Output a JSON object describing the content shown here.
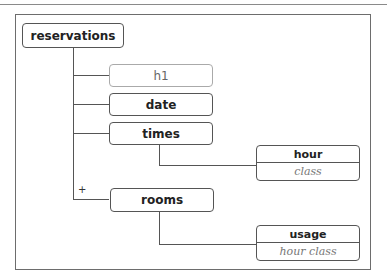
{
  "diagram": {
    "root": {
      "label": "reservations"
    },
    "children": [
      {
        "label": "h1",
        "style": "light"
      },
      {
        "label": "date"
      },
      {
        "label": "times"
      },
      {
        "label": "rooms",
        "marker": "+"
      }
    ],
    "times_child": {
      "label": "hour",
      "sublabel": "class"
    },
    "rooms_child": {
      "label": "usage",
      "sublabel": "hour class"
    }
  }
}
